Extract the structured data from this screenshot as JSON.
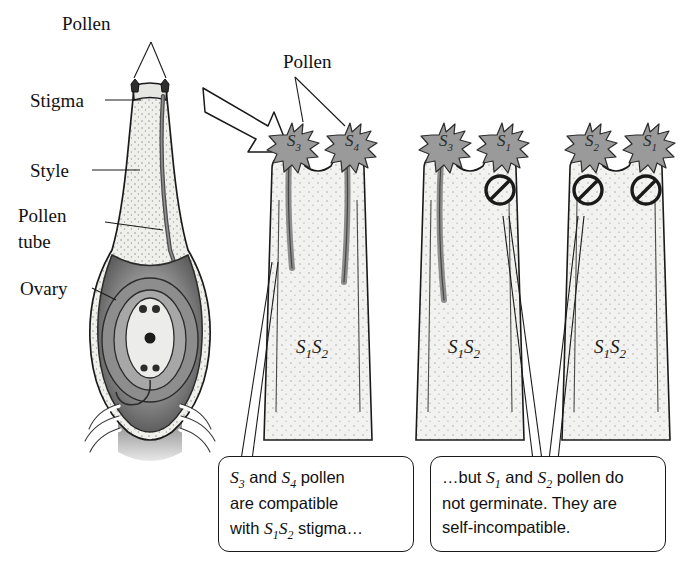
{
  "figure": {
    "type": "biology-diagram"
  },
  "pistil_labels": [
    {
      "id": "pollen",
      "text": "Pollen"
    },
    {
      "id": "stigma",
      "text": "Stigma"
    },
    {
      "id": "style",
      "text": "Style"
    },
    {
      "id": "pollen-tube",
      "text": "Pollen",
      "text2": "tube"
    },
    {
      "id": "ovary",
      "text": "Ovary"
    }
  ],
  "magnified": {
    "pollen_label": "Pollen",
    "stigmas": [
      {
        "id": "stigma-1",
        "genotype": "S",
        "genotype_sub1": "1",
        "genotype_sub2": "S",
        "genotype_sub3": "2",
        "grains": [
          {
            "letter": "S",
            "sub": "3",
            "germinates": true
          },
          {
            "letter": "S",
            "sub": "4",
            "germinates": true
          }
        ]
      },
      {
        "id": "stigma-2",
        "genotype": "S",
        "genotype_sub1": "1",
        "genotype_sub2": "S",
        "genotype_sub3": "2",
        "grains": [
          {
            "letter": "S",
            "sub": "3",
            "germinates": true
          },
          {
            "letter": "S",
            "sub": "1",
            "germinates": false
          }
        ]
      },
      {
        "id": "stigma-3",
        "genotype": "S",
        "genotype_sub1": "1",
        "genotype_sub2": "S",
        "genotype_sub3": "2",
        "grains": [
          {
            "letter": "S",
            "sub": "2",
            "germinates": false
          },
          {
            "letter": "S",
            "sub": "1",
            "germinates": false
          }
        ]
      }
    ]
  },
  "captions": {
    "left": {
      "line1_a": "S",
      "line1_sub1": "3",
      "line1_b": " and ",
      "line1_c": "S",
      "line1_sub2": "4",
      "line1_d": " pollen",
      "line2": "are compatible",
      "line3_a": "with ",
      "line3_b": "S",
      "line3_sub1": "1",
      "line3_c": "S",
      "line3_sub2": "2",
      "line3_d": " stigma…"
    },
    "right": {
      "line1_a": "…but ",
      "line1_b": "S",
      "line1_sub1": "1",
      "line1_c": " and ",
      "line1_d": "S",
      "line1_sub2": "2",
      "line1_e": " pollen do",
      "line2": "not germinate. They are",
      "line3": "self-incompatible."
    }
  },
  "colors": {
    "ink": "#1a1a1a",
    "tissue": "#f0f0ee",
    "pollen_grain": "#9a9a9a",
    "pollen_tube": "#9c9c9c",
    "ovary_dark": "#4a4a4a",
    "ovary_mid": "#8b8b8b",
    "background": "#ffffff"
  }
}
